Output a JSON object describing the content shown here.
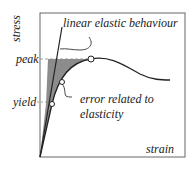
{
  "diagram": {
    "axes": {
      "y_label": "stress",
      "x_label": "strain"
    },
    "ticks": {
      "peak": "peak",
      "yield": "yield"
    },
    "annotations": {
      "linear": "linear elastic behaviour",
      "error_line1": "error related to",
      "error_line2": "elasticity"
    },
    "colors": {
      "curve": "#222222",
      "shade": "#8c8c8c",
      "frame": "#555555"
    }
  }
}
